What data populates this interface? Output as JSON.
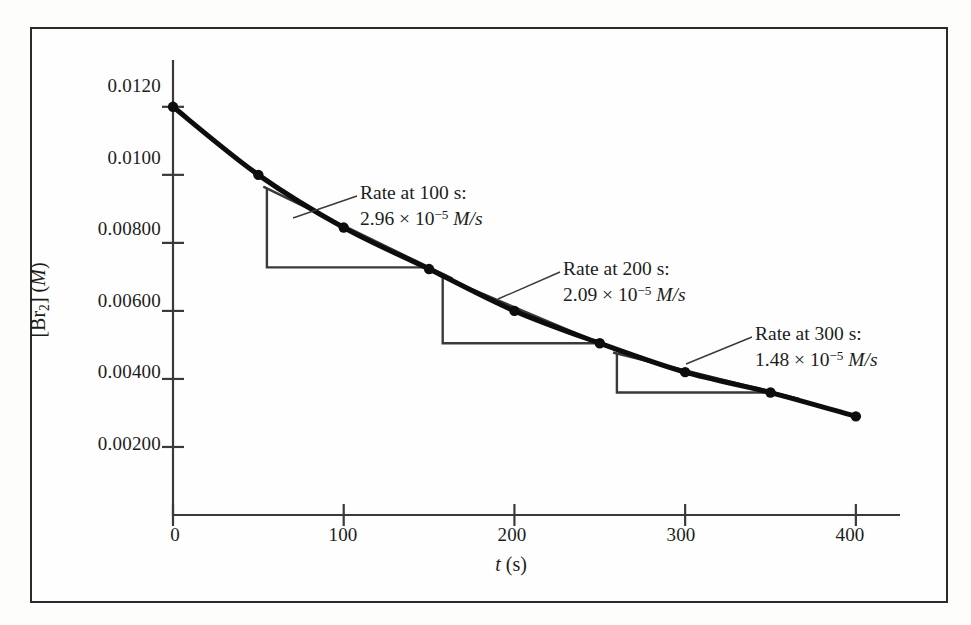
{
  "figure": {
    "background_color": "#fdfdfc",
    "frame_color": "#2b2b2b",
    "curve_color": "#0d0d0d",
    "tangent_color": "#3a3a3a"
  },
  "axes": {
    "y_title_prefix": "[Br",
    "y_title_sub": "2",
    "y_title_mid": "] (",
    "y_title_unit": "M",
    "y_title_suffix": ")",
    "x_title_var": "t",
    "x_title_unit": " (s)",
    "y_ticks": [
      "0.0120",
      "0.0100",
      "0.00800",
      "0.00600",
      "0.00400",
      "0.00200"
    ],
    "y_tick_values": [
      0.012,
      0.01,
      0.008,
      0.006,
      0.004,
      0.002
    ],
    "x_ticks": [
      "0",
      "100",
      "200",
      "300",
      "400"
    ],
    "x_tick_values": [
      0,
      100,
      200,
      300,
      400
    ]
  },
  "annotations": [
    {
      "id": "rate-100",
      "line1": "Rate at 100 s:",
      "value": "2.96",
      "times": " × ",
      "base": "10",
      "exponent": "−5",
      "units": " M/s",
      "t": 100,
      "rate": 2.96e-05
    },
    {
      "id": "rate-200",
      "line1": "Rate at 200 s:",
      "value": "2.09",
      "times": " × ",
      "base": "10",
      "exponent": "−5",
      "units": " M/s",
      "t": 200,
      "rate": 2.09e-05
    },
    {
      "id": "rate-300",
      "line1": "Rate at 300 s:",
      "value": "1.48",
      "times": " × ",
      "base": "10",
      "exponent": "−5",
      "units": " M/s",
      "t": 300,
      "rate": 1.48e-05
    }
  ],
  "chart_data": {
    "type": "line",
    "title": "",
    "xlabel": "t (s)",
    "ylabel": "[Br2] (M)",
    "xlim": [
      0,
      420
    ],
    "ylim": [
      0,
      0.0132
    ],
    "grid": false,
    "legend": "none",
    "x": [
      0,
      50,
      100,
      150,
      200,
      250,
      300,
      350,
      400
    ],
    "values": [
      0.012,
      0.01,
      0.00845,
      0.00723,
      0.006,
      0.00505,
      0.0042,
      0.0036,
      0.0029
    ],
    "series": [
      {
        "name": "[Br2] vs t",
        "x": [
          0,
          50,
          100,
          150,
          200,
          250,
          300,
          350,
          400
        ],
        "values": [
          0.012,
          0.01,
          0.00845,
          0.00723,
          0.006,
          0.00505,
          0.0042,
          0.0036,
          0.0029
        ],
        "markers": true
      }
    ],
    "tangents": [
      {
        "at_t": 100,
        "slope_per_s": -2.96e-05,
        "rate_label": "2.96 × 10−5 M/s",
        "triangle": {
          "t_left": 55,
          "t_right": 150,
          "y_top": 0.0096,
          "y_bottom": 0.00728
        }
      },
      {
        "at_t": 200,
        "slope_per_s": -2.09e-05,
        "rate_label": "2.09 × 10−5 M/s",
        "triangle": {
          "t_left": 158,
          "t_right": 250,
          "y_top": 0.007,
          "y_bottom": 0.00505
        }
      },
      {
        "at_t": 300,
        "slope_per_s": -1.48e-05,
        "rate_label": "1.48 × 10−5 M/s",
        "triangle": {
          "t_left": 260,
          "t_right": 352,
          "y_top": 0.00475,
          "y_bottom": 0.0036
        }
      }
    ]
  }
}
